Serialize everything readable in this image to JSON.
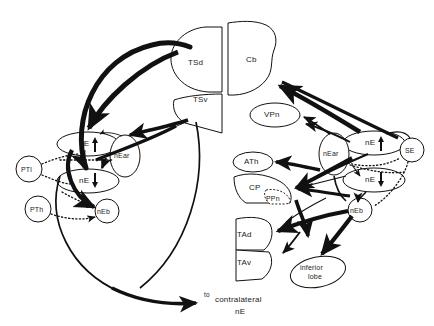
{
  "figure": {
    "type": "neuroanatomical-circuit-diagram",
    "caption_text": {
      "to": "to",
      "contralateral": "contralateral",
      "ne": "nE"
    }
  },
  "nodes": {
    "tsd": {
      "label": "TSd",
      "shape": "half-disc",
      "side": "midline-left",
      "x": 198,
      "y": 62
    },
    "tsv": {
      "label": "TSv",
      "shape": "wedge",
      "side": "midline-left",
      "x": 204,
      "y": 99
    },
    "cb": {
      "label": "Cb",
      "shape": "blob",
      "side": "midline-right",
      "x": 254,
      "y": 60
    },
    "vpn": {
      "label": "VPn",
      "shape": "ellipse",
      "side": "right",
      "x": 273,
      "y": 115
    },
    "ath": {
      "label": "ATh",
      "shape": "ellipse",
      "side": "right",
      "x": 252,
      "y": 162
    },
    "cp": {
      "label": "CP",
      "shape": "crescent",
      "side": "right",
      "x": 256,
      "y": 188
    },
    "ppn": {
      "label": "PPn",
      "shape": "dashed-lobe",
      "side": "right",
      "x": 274,
      "y": 201
    },
    "tad": {
      "label": "TAd",
      "shape": "half-disc",
      "side": "right",
      "x": 243,
      "y": 236
    },
    "tav": {
      "label": "TAv",
      "shape": "half-disc",
      "side": "right",
      "x": 243,
      "y": 263
    },
    "inferior_lobe": {
      "label": "inferior\nlobe",
      "line1": "inferior",
      "line2": "lobe",
      "shape": "ellipse",
      "side": "right",
      "x": 318,
      "y": 272
    },
    "ne_up_left": {
      "label": "nE",
      "arrow": "up",
      "shape": "ellipse",
      "side": "left",
      "x": 88,
      "y": 144
    },
    "ne_dn_left": {
      "label": "nE",
      "arrow": "down",
      "shape": "ellipse",
      "side": "left",
      "x": 88,
      "y": 181
    },
    "near_left": {
      "label": "nEar",
      "shape": "ellipse",
      "side": "left",
      "x": 125,
      "y": 155
    },
    "neb_left": {
      "label": "nEb",
      "shape": "circle",
      "side": "left",
      "x": 107,
      "y": 211
    },
    "ptl": {
      "label": "PTl",
      "shape": "circle",
      "side": "left",
      "x": 29,
      "y": 169
    },
    "pth": {
      "label": "PTh",
      "shape": "circle",
      "side": "left",
      "x": 38,
      "y": 209
    },
    "ne_up_right": {
      "label": "nE",
      "arrow": "up",
      "shape": "ellipse",
      "side": "right",
      "x": 374,
      "y": 143
    },
    "ne_dn_right": {
      "label": "nE",
      "arrow": "down",
      "shape": "ellipse",
      "side": "right",
      "x": 374,
      "y": 180
    },
    "near_right": {
      "label": "nEar",
      "shape": "ellipse",
      "side": "right",
      "x": 334,
      "y": 153
    },
    "neb_right": {
      "label": "nEb",
      "shape": "circle",
      "side": "right",
      "x": 360,
      "y": 210
    },
    "se": {
      "label": "SE",
      "shape": "circle",
      "side": "right",
      "x": 412,
      "y": 150
    }
  },
  "colors": {
    "stroke": "#111111",
    "fill": "#ffffff",
    "text": "#1a1a1a"
  }
}
